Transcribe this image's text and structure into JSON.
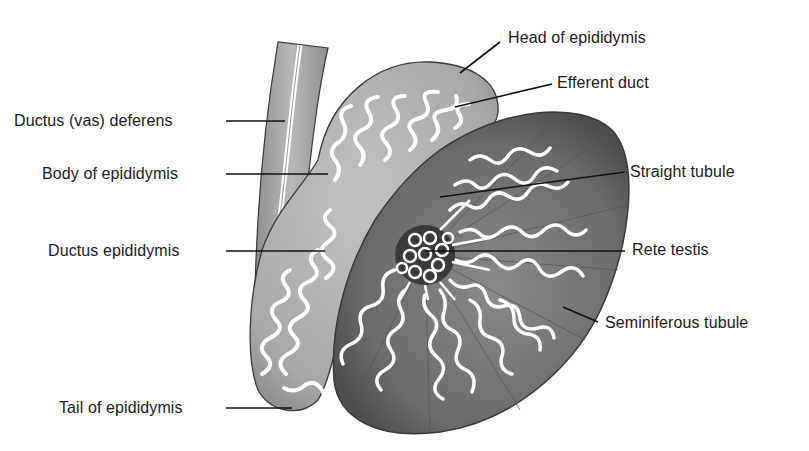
{
  "diagram": {
    "colors": {
      "background": "#ffffff",
      "epididymis_fill": "#b0b0b0",
      "vas_fill": "#a8a8a8",
      "testis_fill": "#6e6e6e",
      "testis_edge": "#4a4a4a",
      "tubule_stroke": "#ffffff",
      "tubule_outline": "#2a2a2a",
      "leader_line": "#111111",
      "label_text": "#1a1a1a"
    },
    "labels": {
      "head_of_epididymis": "Head of epididymis",
      "efferent_duct": "Efferent duct",
      "ductus_deferens": "Ductus (vas) deferens",
      "body_of_epididymis": "Body of epididymis",
      "straight_tubule": "Straight tubule",
      "ductus_epididymis": "Ductus epididymis",
      "rete_testis": "Rete testis",
      "seminiferous_tubule": "Seminiferous tubule",
      "tail_of_epididymis": "Tail of epididymis"
    }
  }
}
